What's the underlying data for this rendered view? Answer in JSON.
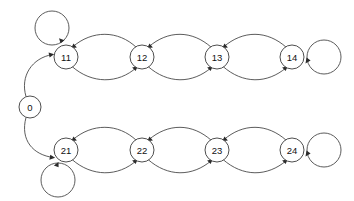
{
  "diagram": {
    "type": "state-transition-graph",
    "title": "",
    "background_color": "#ffffff",
    "stroke_color": "#4a4a4a",
    "node_fill_color": "#ffffff",
    "label_color": "#111111",
    "arrow_color": "#2b2b2b",
    "node_radius": 11,
    "start_node": "0",
    "nodes": [
      {
        "id": "n0",
        "label": "0",
        "cx": 30,
        "cy": 107,
        "r": 11
      },
      {
        "id": "n11",
        "label": "11",
        "cx": 66,
        "cy": 57,
        "r": 12
      },
      {
        "id": "n12",
        "label": "12",
        "cx": 142,
        "cy": 57,
        "r": 12
      },
      {
        "id": "n13",
        "label": "13",
        "cx": 217,
        "cy": 57,
        "r": 12
      },
      {
        "id": "n14",
        "label": "14",
        "cx": 292,
        "cy": 57,
        "r": 12
      },
      {
        "id": "n21",
        "label": "21",
        "cx": 66,
        "cy": 150,
        "r": 12
      },
      {
        "id": "n22",
        "label": "22",
        "cx": 142,
        "cy": 150,
        "r": 12
      },
      {
        "id": "n23",
        "label": "23",
        "cx": 217,
        "cy": 150,
        "r": 12
      },
      {
        "id": "n24",
        "label": "24",
        "cx": 292,
        "cy": 150,
        "r": 12
      }
    ],
    "self_loops": [
      {
        "node": "n11",
        "label": "",
        "position": "above",
        "cx": 52,
        "cy": 28,
        "r": 17
      },
      {
        "node": "n14",
        "label": "",
        "position": "right",
        "cx": 324,
        "cy": 57,
        "r": 17
      },
      {
        "node": "n21",
        "label": "",
        "position": "below",
        "cx": 58,
        "cy": 180,
        "r": 17
      },
      {
        "node": "n24",
        "label": "",
        "position": "right",
        "cx": 324,
        "cy": 150,
        "r": 17
      }
    ],
    "edges": [
      {
        "from": "n0",
        "to": "n11",
        "label": "",
        "style": "curved"
      },
      {
        "from": "n0",
        "to": "n21",
        "label": "",
        "style": "curved"
      },
      {
        "from": "n11",
        "to": "n12",
        "label": "",
        "style": "curved-lower"
      },
      {
        "from": "n12",
        "to": "n11",
        "label": "",
        "style": "curved-upper"
      },
      {
        "from": "n12",
        "to": "n13",
        "label": "",
        "style": "curved-lower"
      },
      {
        "from": "n13",
        "to": "n12",
        "label": "",
        "style": "curved-upper"
      },
      {
        "from": "n13",
        "to": "n14",
        "label": "",
        "style": "curved-lower"
      },
      {
        "from": "n14",
        "to": "n13",
        "label": "",
        "style": "curved-upper"
      },
      {
        "from": "n21",
        "to": "n22",
        "label": "",
        "style": "curved-lower"
      },
      {
        "from": "n22",
        "to": "n21",
        "label": "",
        "style": "curved-upper"
      },
      {
        "from": "n22",
        "to": "n23",
        "label": "",
        "style": "curved-lower"
      },
      {
        "from": "n23",
        "to": "n22",
        "label": "",
        "style": "curved-upper"
      },
      {
        "from": "n23",
        "to": "n24",
        "label": "",
        "style": "curved-lower"
      },
      {
        "from": "n24",
        "to": "n23",
        "label": "",
        "style": "curved-upper"
      }
    ]
  }
}
